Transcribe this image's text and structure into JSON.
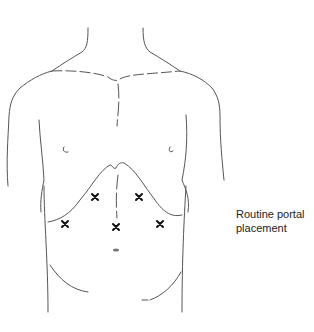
{
  "figure": {
    "title": "Routine portal placement",
    "caption_lines": [
      "Routine portal",
      "placement"
    ],
    "stroke_color": "#555555",
    "marker_color": "#111111",
    "portals": [
      {
        "id": "left-upper",
        "x": 95,
        "y": 197
      },
      {
        "id": "right-upper",
        "x": 139,
        "y": 197
      },
      {
        "id": "left-lower",
        "x": 65,
        "y": 224
      },
      {
        "id": "center",
        "x": 116,
        "y": 227
      },
      {
        "id": "right-lower",
        "x": 160,
        "y": 224
      }
    ],
    "navel": {
      "x": 116,
      "y": 250
    }
  }
}
